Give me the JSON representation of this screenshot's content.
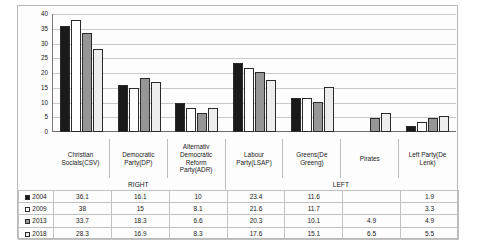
{
  "chart_data": {
    "type": "bar",
    "title": "",
    "xlabel": "",
    "ylabel": "",
    "ylim": [
      0,
      40
    ],
    "yticks": [
      40,
      35,
      30,
      25,
      20,
      15,
      10,
      5,
      0
    ],
    "grid": true,
    "legend_position": "table-left",
    "categories": [
      "Christian Socials(CSV)",
      "Democratic Party(DP)",
      "Alternativ Democratic Reform Party(ADR)",
      "Labour Party(LSAP)",
      "Greens(De Greeng)",
      "Pirates",
      "Left Party(De Lenk)"
    ],
    "category_groups": [
      {
        "label": "RIGHT",
        "span": 3
      },
      {
        "label": "LEFT",
        "span": 4
      }
    ],
    "series": [
      {
        "name": "2004",
        "color": "#1a1a1a",
        "values": [
          36.1,
          16.1,
          10,
          23.4,
          11.6,
          null,
          1.9
        ],
        "display": [
          "36.1",
          "16.1",
          "10",
          "23.4",
          "11.6",
          "",
          "1.9"
        ]
      },
      {
        "name": "2009",
        "color": "#ffffff",
        "values": [
          38,
          15,
          8.1,
          21.6,
          11.7,
          null,
          3.3
        ],
        "display": [
          "38",
          "15",
          "8.1",
          "21.6",
          "11.7",
          "",
          "3.3"
        ]
      },
      {
        "name": "2013",
        "color": "#969696",
        "values": [
          33.7,
          18.3,
          6.6,
          20.3,
          10.1,
          4.9,
          4.9
        ],
        "display": [
          "33.7",
          "18.3",
          "6.6",
          "20.3",
          "10.1",
          "4.9",
          "4.9"
        ]
      },
      {
        "name": "2018",
        "color": "#ededed",
        "values": [
          28.3,
          16.9,
          8.3,
          17.6,
          15.1,
          6.5,
          5.5
        ],
        "display": [
          "28.3",
          "16.9",
          "8.3",
          "17.6",
          "15.1",
          "6.5",
          "5.5"
        ]
      }
    ]
  }
}
